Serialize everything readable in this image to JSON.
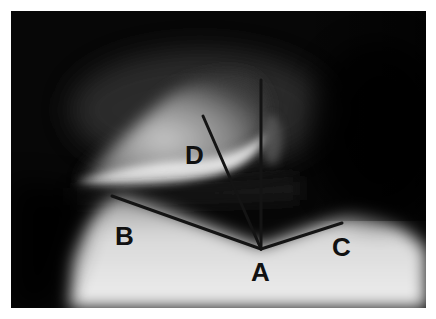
{
  "figure": {
    "kind": "radiograph",
    "labels": [
      {
        "id": "A",
        "text": "A",
        "x": 251,
        "y": 259
      },
      {
        "id": "B",
        "text": "B",
        "x": 115,
        "y": 223
      },
      {
        "id": "C",
        "text": "C",
        "x": 332,
        "y": 234
      },
      {
        "id": "D",
        "text": "D",
        "x": 185,
        "y": 142
      }
    ],
    "lines": [
      {
        "id": "line-AB",
        "from": "A",
        "x1": 261,
        "y1": 249,
        "x2": 112,
        "y2": 196
      },
      {
        "id": "line-AC",
        "from": "A",
        "x1": 261,
        "y1": 249,
        "x2": 342,
        "y2": 223
      },
      {
        "id": "line-AD",
        "from": "A",
        "x1": 261,
        "y1": 249,
        "x2": 203,
        "y2": 116
      },
      {
        "id": "line-vertical",
        "from": "A",
        "x1": 261,
        "y1": 249,
        "x2": 261,
        "y2": 80
      }
    ],
    "colors": {
      "background": "#060606",
      "line": "#141414",
      "label": "#111111",
      "border": "#ffffff"
    }
  }
}
